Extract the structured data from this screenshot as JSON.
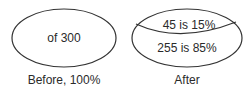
{
  "diagram": {
    "before": {
      "inside_text": "of 300",
      "caption": "Before, 100%"
    },
    "after": {
      "top_segment_text": "45 is 15%",
      "bottom_segment_text": "255 is 85%",
      "caption": "After"
    }
  }
}
